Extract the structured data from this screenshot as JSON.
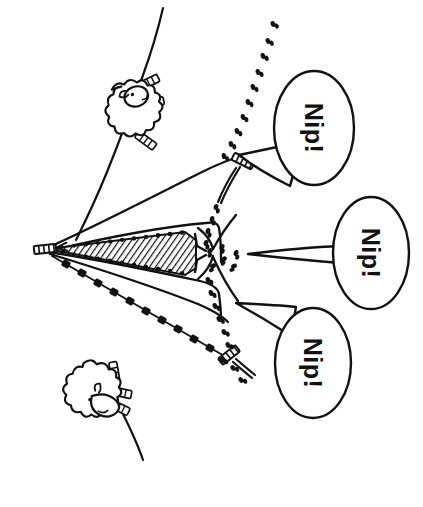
{
  "image": {
    "title": "Nip! sheepdog herding illustration",
    "style": "hand-drawn black ink line art",
    "orientation_note": "drawing rotated 90 degrees clockwise",
    "width": 423,
    "height": 507,
    "background_color": "#ffffff",
    "ink_color": "#111111"
  },
  "speech_bubbles": [
    {
      "id": "bubble-top",
      "text": "Nip!",
      "cx": 314,
      "cy": 128,
      "rx": 40,
      "ry": 56,
      "rotation": 90
    },
    {
      "id": "bubble-middle",
      "text": "Nip!",
      "cx": 371,
      "cy": 253,
      "rx": 37,
      "ry": 55,
      "rotation": 90
    },
    {
      "id": "bubble-bottom",
      "text": "Nip!",
      "cx": 313,
      "cy": 363,
      "rx": 38,
      "ry": 54,
      "rotation": 90
    }
  ],
  "sheep": [
    {
      "id": "sheep-upper",
      "label": "sheep",
      "x": 120,
      "y": 108
    },
    {
      "id": "sheep-lower",
      "label": "sheep",
      "x": 85,
      "y": 382
    }
  ],
  "stakes": [
    {
      "id": "stake-apex",
      "label": "stake",
      "x": 45,
      "y": 247
    },
    {
      "id": "stake-upper",
      "label": "stake",
      "x": 243,
      "y": 161
    },
    {
      "id": "stake-lower",
      "label": "stake",
      "x": 229,
      "y": 355
    }
  ],
  "features": {
    "funnel_label": "hatched funnel chute",
    "trail_label": "footprint trail",
    "fence_label": "fence line",
    "dashed_fence_label": "dashed fence line"
  },
  "colors": {
    "ink": "#111111",
    "paper": "#ffffff"
  }
}
